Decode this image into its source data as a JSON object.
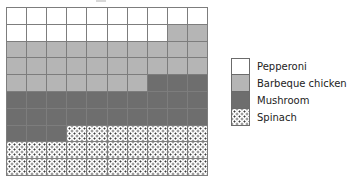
{
  "chart_data": {
    "type": "waffle",
    "title": "",
    "subtitle": "",
    "xlabel": "",
    "ylabel": "",
    "grid": true,
    "grid_columns": 10,
    "grid_rows": 10,
    "total_cells": 100,
    "fill_order": "row-major, top-left to bottom-right",
    "legend_position": "right",
    "categories": [
      "Pepperoni",
      "Barbeque chicken",
      "Mushroom",
      "Spinach"
    ],
    "values": [
      18,
      29,
      26,
      27
    ],
    "series": [
      {
        "name": "Pepperoni",
        "value": 18,
        "color": "#ffffff",
        "pattern": "solid"
      },
      {
        "name": "Barbeque chicken",
        "value": 29,
        "color": "#b5b5b5",
        "pattern": "solid"
      },
      {
        "name": "Mushroom",
        "value": 26,
        "color": "#6e6e6e",
        "pattern": "solid"
      },
      {
        "name": "Spinach",
        "value": 27,
        "color": "#ffffff",
        "pattern": "dotted"
      }
    ],
    "cells": [
      "pepperoni",
      "pepperoni",
      "pepperoni",
      "pepperoni",
      "pepperoni",
      "pepperoni",
      "pepperoni",
      "pepperoni",
      "pepperoni",
      "pepperoni",
      "pepperoni",
      "pepperoni",
      "pepperoni",
      "pepperoni",
      "pepperoni",
      "pepperoni",
      "pepperoni",
      "pepperoni",
      "barbeque",
      "barbeque",
      "barbeque",
      "barbeque",
      "barbeque",
      "barbeque",
      "barbeque",
      "barbeque",
      "barbeque",
      "barbeque",
      "barbeque",
      "barbeque",
      "barbeque",
      "barbeque",
      "barbeque",
      "barbeque",
      "barbeque",
      "barbeque",
      "barbeque",
      "barbeque",
      "barbeque",
      "barbeque",
      "barbeque",
      "barbeque",
      "barbeque",
      "barbeque",
      "barbeque",
      "barbeque",
      "barbeque",
      "mushroom",
      "mushroom",
      "mushroom",
      "mushroom",
      "mushroom",
      "mushroom",
      "mushroom",
      "mushroom",
      "mushroom",
      "mushroom",
      "mushroom",
      "mushroom",
      "mushroom",
      "mushroom",
      "mushroom",
      "mushroom",
      "mushroom",
      "mushroom",
      "mushroom",
      "mushroom",
      "mushroom",
      "mushroom",
      "mushroom",
      "mushroom",
      "mushroom",
      "mushroom",
      "spinach",
      "spinach",
      "spinach",
      "spinach",
      "spinach",
      "spinach",
      "spinach",
      "spinach",
      "spinach",
      "spinach",
      "spinach",
      "spinach",
      "spinach",
      "spinach",
      "spinach",
      "spinach",
      "spinach",
      "spinach",
      "spinach",
      "spinach",
      "spinach",
      "spinach",
      "spinach",
      "spinach",
      "spinach",
      "spinach",
      "spinach"
    ]
  },
  "legend": {
    "items": [
      {
        "label": "Pepperoni",
        "key": "pepperoni"
      },
      {
        "label": "Barbeque chicken",
        "key": "barbeque"
      },
      {
        "label": "Mushroom",
        "key": "mushroom"
      },
      {
        "label": "Spinach",
        "key": "spinach"
      }
    ]
  },
  "colors": {
    "pepperoni": "#ffffff",
    "barbeque": "#b5b5b5",
    "mushroom": "#6e6e6e",
    "spinach_dot": "#3c3c3c",
    "gridline": "#7d7d7d",
    "text": "#1c1c1c"
  }
}
